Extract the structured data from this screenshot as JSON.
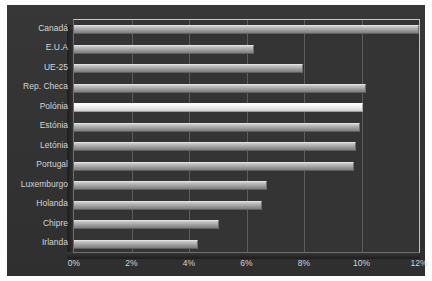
{
  "chart_data": {
    "type": "bar",
    "orientation": "horizontal",
    "title": "",
    "subtitle": "",
    "xlabel": "",
    "ylabel": "",
    "categories": [
      "Canadá",
      "E.U.A",
      "UE-25",
      "Rep. Checa",
      "Polónia",
      "Estónia",
      "Letónia",
      "Portugal",
      "Luxemburgo",
      "Holanda",
      "Chipre",
      "Irlanda"
    ],
    "values": [
      12.0,
      6.25,
      7.95,
      10.15,
      10.05,
      9.95,
      9.8,
      9.75,
      6.7,
      6.55,
      5.05,
      4.3
    ],
    "value_unit": "%",
    "xlim": [
      0,
      12
    ],
    "xticks": [
      0,
      2,
      4,
      6,
      8,
      10,
      12
    ],
    "xtick_labels": [
      "0%",
      "2%",
      "4%",
      "6%",
      "8%",
      "10%",
      "12%"
    ],
    "grid": "vertical",
    "legend": "none",
    "highlight_category": "Polónia",
    "series": [
      {
        "name": "",
        "values": [
          12.0,
          6.25,
          7.95,
          10.15,
          10.05,
          9.95,
          9.8,
          9.75,
          6.7,
          6.55,
          5.05,
          4.3
        ]
      }
    ],
    "colors": {
      "background": "#323232",
      "plot_background": "#343434",
      "bar": "#b6b6b6",
      "bar_highlight": "#f4f4f4",
      "gridline": "#bebebe",
      "axis": "#b9b9b9",
      "text": "#d4d4d4"
    }
  }
}
